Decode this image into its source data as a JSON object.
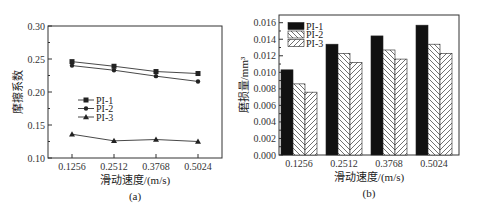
{
  "chart_data": [
    {
      "type": "line",
      "panel": "(a)",
      "title": "",
      "xlabel": "滑动速度/(m/s)",
      "ylabel": "摩擦系数",
      "categories": [
        "0.1256",
        "0.2512",
        "0.3768",
        "0.5024"
      ],
      "yticks": [
        "0.10",
        "0.15",
        "0.20",
        "0.25",
        "0.30"
      ],
      "ylim": [
        0.1,
        0.3
      ],
      "grid": false,
      "legend_position": "middle-left",
      "series": [
        {
          "name": "PI-1",
          "marker": "square",
          "values": [
            0.246,
            0.239,
            0.231,
            0.228
          ]
        },
        {
          "name": "PI-2",
          "marker": "circle",
          "values": [
            0.24,
            0.233,
            0.224,
            0.216
          ]
        },
        {
          "name": "PI-3",
          "marker": "triangle",
          "values": [
            0.136,
            0.126,
            0.128,
            0.125
          ]
        }
      ]
    },
    {
      "type": "bar",
      "panel": "(b)",
      "title": "",
      "xlabel": "滑动速度/(m/s)",
      "ylabel": "磨损量/mm³",
      "categories": [
        "0.1256",
        "0.2512",
        "0.3768",
        "0.5024"
      ],
      "yticks": [
        "0.000",
        "0.002",
        "0.004",
        "0.006",
        "0.008",
        "0.010",
        "0.012",
        "0.014",
        "0.016"
      ],
      "ylim": [
        0.0,
        0.017
      ],
      "grid": false,
      "legend_position": "top-left",
      "series": [
        {
          "name": "PI-1",
          "fill": "solid-black",
          "values": [
            0.0103,
            0.0134,
            0.0144,
            0.0157
          ]
        },
        {
          "name": "PI-2",
          "fill": "hatch-backslash",
          "values": [
            0.0086,
            0.0123,
            0.0127,
            0.0134
          ]
        },
        {
          "name": "PI-3",
          "fill": "hatch-slash",
          "values": [
            0.0076,
            0.0112,
            0.0116,
            0.0123
          ]
        }
      ]
    }
  ]
}
